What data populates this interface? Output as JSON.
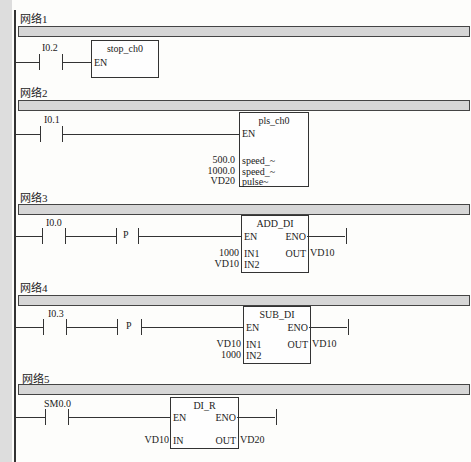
{
  "networks": [
    {
      "label": "网络1",
      "contact": "I0.2",
      "block": {
        "title": "stop_ch0",
        "inputs": [
          "EN"
        ]
      }
    },
    {
      "label": "网络2",
      "contact": "I0.1",
      "block": {
        "title": "pls_ch0",
        "inputs": [
          "EN",
          "speed_~",
          "speed_~",
          "pulse~"
        ],
        "input_values": [
          "500.0",
          "1000.0",
          "VD20"
        ]
      }
    },
    {
      "label": "网络3",
      "contact": "I0.0",
      "edge": "P",
      "block": {
        "title": "ADD_DI",
        "inputs": [
          "EN",
          "IN1",
          "IN2"
        ],
        "outputs": [
          "ENO",
          "OUT"
        ],
        "input_values": [
          "1000",
          "VD10"
        ],
        "output_values": [
          "VD10"
        ]
      }
    },
    {
      "label": "网络4",
      "contact": "I0.3",
      "edge": "P",
      "block": {
        "title": "SUB_DI",
        "inputs": [
          "EN",
          "IN1",
          "IN2"
        ],
        "outputs": [
          "ENO",
          "OUT"
        ],
        "input_values": [
          "VD10",
          "1000"
        ],
        "output_values": [
          "VD10"
        ]
      }
    },
    {
      "label": "网络5",
      "contact": "SM0.0",
      "block": {
        "title": "DI_R",
        "inputs": [
          "EN",
          "IN"
        ],
        "outputs": [
          "ENO",
          "OUT"
        ],
        "input_values": [
          "VD10"
        ],
        "output_values": [
          "VD20"
        ]
      }
    }
  ]
}
